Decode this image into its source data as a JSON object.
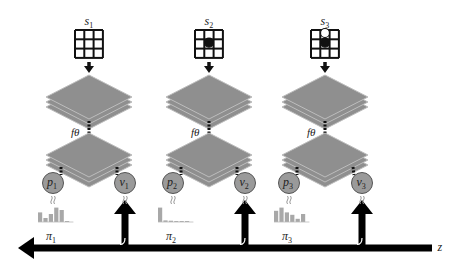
{
  "diagram": {
    "type": "self-play search/training pipeline",
    "network_label": "fθ",
    "axis_label": "z",
    "columns": [
      {
        "state_label": "s",
        "state_index": "1",
        "policy_label": "p",
        "policy_index": "1",
        "value_label": "v",
        "value_index": "1",
        "search_policy_label": "π",
        "search_policy_index": "1",
        "board_stones": [],
        "histogram": [
          0.6,
          0.25,
          0.5,
          0.9,
          0.75,
          0.05
        ]
      },
      {
        "state_label": "s",
        "state_index": "2",
        "policy_label": "p",
        "policy_index": "2",
        "value_label": "v",
        "value_index": "2",
        "search_policy_label": "π",
        "search_policy_index": "2",
        "board_stones": [
          {
            "row": 1,
            "col": 1,
            "color": "black"
          }
        ],
        "histogram": [
          0.9,
          0.1,
          0.08,
          0.06,
          0.05,
          0.05
        ]
      },
      {
        "state_label": "s",
        "state_index": "3",
        "policy_label": "p",
        "policy_index": "3",
        "value_label": "v",
        "value_index": "3",
        "search_policy_label": "π",
        "search_policy_index": "3",
        "board_stones": [
          {
            "row": 0,
            "col": 1,
            "color": "white"
          },
          {
            "row": 1,
            "col": 1,
            "color": "black"
          }
        ],
        "histogram": [
          0.7,
          0.9,
          0.6,
          0.45,
          0.2,
          0.5
        ]
      }
    ],
    "colors": {
      "layer_fill": "#8f8f8f",
      "layer_edge": "#bdbdbd",
      "node_fill": "#9a9a9a",
      "histogram_bar": "#a8a8a8",
      "arrow": "#000000"
    }
  }
}
